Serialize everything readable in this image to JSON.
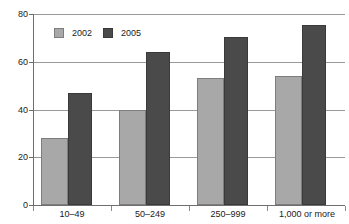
{
  "chart_data": {
    "type": "bar",
    "title": "",
    "xlabel": "",
    "ylabel": "",
    "ylim": [
      0,
      80
    ],
    "yticks": [
      0,
      20,
      40,
      60,
      80
    ],
    "ytick_labels": [
      "0",
      "20",
      "40",
      "60",
      "80"
    ],
    "grid": true,
    "legend_position": "top-left",
    "categories": [
      "10–49",
      "50–249",
      "250–999",
      "1,000 or more"
    ],
    "series": [
      {
        "name": "2002",
        "color": "#a8a8a8",
        "values": [
          28,
          40,
          53,
          54
        ]
      },
      {
        "name": "2005",
        "color": "#4a4a4a",
        "values": [
          47,
          64,
          70.5,
          75.5
        ]
      }
    ]
  },
  "legend": {
    "entries": [
      {
        "label": "2002"
      },
      {
        "label": "2005"
      }
    ]
  },
  "axes": {
    "y_labels": [
      "80",
      "60",
      "40",
      "20",
      "0"
    ],
    "x_labels": [
      "10–49",
      "50–249",
      "250–999",
      "1,000 or more"
    ]
  },
  "colors": {
    "series_2002": "#a8a8a8",
    "series_2005": "#4a4a4a",
    "gridline": "#9a9a9a",
    "axis": "#6e6e6e",
    "text": "#1a1a1a",
    "background": "#ffffff"
  }
}
